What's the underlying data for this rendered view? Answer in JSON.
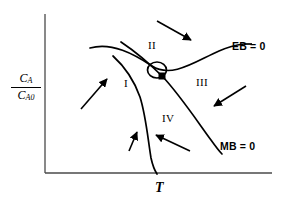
{
  "figure": {
    "type": "phase-plane-diagram",
    "background_color": "#ffffff",
    "line_color": "#000000",
    "axis_color": "#555555"
  },
  "axes": {
    "x_label": "T",
    "y_label_numerator": "C",
    "y_label_numerator_sub": "A",
    "y_label_denominator": "C",
    "y_label_denominator_sub": "A0",
    "x_origin_px": 45,
    "y_origin_px": 173,
    "x_end_px": 270,
    "y_top_px": 14
  },
  "curves": [
    {
      "id": "eb-curve",
      "label": "EB = 0",
      "label_x": 232,
      "label_y": 47,
      "description": "energy balance curve, S-shaped rising left to right"
    },
    {
      "id": "mb-curve",
      "label": "MB = 0",
      "label_x": 222,
      "label_y": 147,
      "description": "mass balance curve, S-shaped falling left to right"
    }
  ],
  "regions": [
    {
      "id": "region-1",
      "label": "I",
      "x": 126,
      "y": 84
    },
    {
      "id": "region-2",
      "label": "II",
      "x": 152,
      "y": 46
    },
    {
      "id": "region-3",
      "label": "III",
      "x": 201,
      "y": 83
    },
    {
      "id": "region-4",
      "label": "IV",
      "x": 167,
      "y": 119
    }
  ],
  "markers": [
    {
      "id": "steady-state-point",
      "shape": "filled-square",
      "x": 162,
      "y": 76,
      "size": 6,
      "color": "#000000"
    },
    {
      "id": "limit-cycle-loop",
      "shape": "open-circle",
      "cx": 157,
      "cy": 71,
      "rx": 9,
      "ry": 8,
      "color": "#000000"
    }
  ],
  "arrows": [
    {
      "id": "arrow-region-2",
      "x1": 157,
      "y1": 21,
      "x2": 193,
      "y2": 41,
      "direction": "down-right"
    },
    {
      "id": "arrow-region-1",
      "x1": 81,
      "y1": 109,
      "x2": 109,
      "y2": 78,
      "direction": "up-right"
    },
    {
      "id": "arrow-region-3",
      "x1": 246,
      "y1": 86,
      "x2": 212,
      "y2": 107,
      "direction": "down-left"
    },
    {
      "id": "arrow-region-4",
      "x1": 190,
      "y1": 151,
      "x2": 154,
      "y2": 134,
      "direction": "up-left"
    },
    {
      "id": "arrow-on-mb-curve",
      "x1": 128,
      "y1": 152,
      "x2": 137,
      "y2": 131,
      "direction": "up"
    }
  ]
}
